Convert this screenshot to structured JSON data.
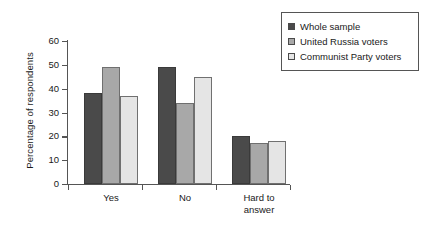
{
  "chart_data": {
    "type": "bar",
    "title": "",
    "xlabel": "",
    "ylabel": "Percentage of respondents",
    "categories": [
      "Yes",
      "No",
      "Hard to\nanswer"
    ],
    "category_labels": [
      {
        "line1": "Yes",
        "line2": ""
      },
      {
        "line1": "No",
        "line2": ""
      },
      {
        "line1": "Hard to",
        "line2": "answer"
      }
    ],
    "series": [
      {
        "name": "Whole sample",
        "color": "#4a4a4a",
        "values": [
          38,
          49,
          20
        ]
      },
      {
        "name": "United Russia voters",
        "color": "#a8a8a8",
        "values": [
          49,
          34,
          17
        ]
      },
      {
        "name": "Communist Party voters",
        "color": "#e5e5e5",
        "values": [
          37,
          45,
          18
        ]
      }
    ],
    "grouped_values": {
      "Yes": {
        "Whole sample": 38,
        "United Russia voters": 49,
        "Communist Party voters": 37
      },
      "No": {
        "Whole sample": 43,
        "United Russia voters": 34,
        "Communist Party voters": 45
      },
      "Hard to answer": {
        "Whole sample": 20,
        "United Russia voters": 17,
        "Communist Party voters": 18
      }
    },
    "ylim": [
      0,
      60
    ],
    "ytick_values": [
      0,
      10,
      20,
      30,
      40,
      50,
      60
    ],
    "ytick_labels": [
      "0",
      "10",
      "20",
      "30",
      "40",
      "50",
      "60"
    ],
    "grid": false,
    "legend_position": "top-right",
    "legend_entries": [
      "Whole sample",
      "United Russia voters",
      "Communist Party voters"
    ]
  },
  "legend": {
    "items": [
      {
        "label": "Whole sample",
        "color": "#4a4a4a"
      },
      {
        "label": "United Russia voters",
        "color": "#a8a8a8"
      },
      {
        "label": "Communist Party voters",
        "color": "#e5e5e5"
      }
    ]
  },
  "axes": {
    "y_title": "Percentage of respondents",
    "y_ticks": [
      "60",
      "50",
      "40",
      "30",
      "20",
      "10",
      "0"
    ]
  }
}
